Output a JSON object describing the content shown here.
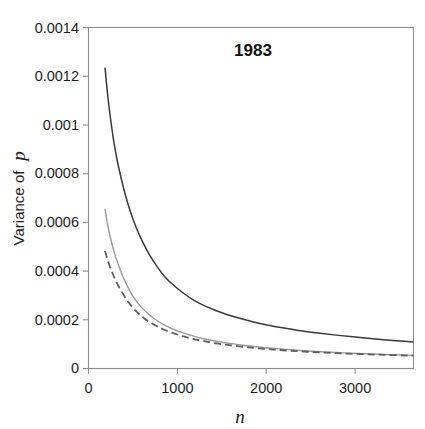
{
  "figure": {
    "background_color": "#ffffff",
    "width": 425,
    "height": 429
  },
  "chart_data": {
    "type": "line",
    "title": "1983",
    "xlabel": "n",
    "ylabel": "Variance of p",
    "ylabel_plain": "Variance of",
    "ylabel_italic": "p",
    "xlim": [
      0,
      3740
    ],
    "ylim": [
      0,
      0.0014
    ],
    "grid": false,
    "legend": "none",
    "x_ticks": [
      0,
      1000,
      2000,
      3000
    ],
    "x_tick_labels": [
      "0",
      "1000",
      "2000",
      "3000"
    ],
    "y_ticks": [
      0,
      0.0002,
      0.0004,
      0.0006,
      0.0008,
      0.001,
      0.0012,
      0.0014
    ],
    "y_tick_labels": [
      "0",
      "0.0002",
      "0.0004",
      "0.0006",
      "0.0008",
      "0.001",
      "0.0012",
      "0.0014"
    ],
    "frame_color": "#8d8d8d",
    "series": [
      {
        "name": "upper-curve",
        "color": "#3a3a3a",
        "width": 1.5,
        "dash": "none",
        "x": [
          190,
          220,
          250,
          290,
          330,
          380,
          430,
          490,
          550,
          620,
          700,
          790,
          880,
          980,
          1090,
          1200,
          1320,
          1450,
          1590,
          1740,
          1900,
          2070,
          2250,
          2440,
          2640,
          2850,
          3070,
          3300,
          3540,
          3740
        ],
        "y": [
          0.001235,
          0.001125,
          0.001035,
          0.000935,
          0.000855,
          0.000775,
          0.000705,
          0.000635,
          0.000578,
          0.000522,
          0.000468,
          0.000418,
          0.000376,
          0.000342,
          0.00031,
          0.000283,
          0.00026,
          0.00024,
          0.000222,
          0.000206,
          0.000191,
          0.000178,
          0.000166,
          0.000155,
          0.000146,
          0.000137,
          0.000129,
          0.000121,
          0.000114,
          0.000109
        ]
      },
      {
        "name": "middle-curve",
        "color": "#9a9a9a",
        "width": 1.4,
        "dash": "none",
        "x": [
          190,
          215,
          245,
          280,
          320,
          365,
          415,
          470,
          530,
          600,
          680,
          770,
          865,
          970,
          1080,
          1200,
          1330,
          1470,
          1620,
          1780,
          1950,
          2130,
          2320,
          2520,
          2730,
          2950,
          3180,
          3420,
          3670,
          3740
        ],
        "y": [
          0.000655,
          0.0006,
          0.000548,
          0.000498,
          0.00045,
          0.000405,
          0.000362,
          0.000322,
          0.000287,
          0.000255,
          0.000226,
          0.000201,
          0.00018,
          0.000162,
          0.000147,
          0.000134,
          0.000122,
          0.000112,
          0.000103,
          9.55e-05,
          8.85e-05,
          8.25e-05,
          7.7e-05,
          7.2e-05,
          6.78e-05,
          6.4e-05,
          6.06e-05,
          5.76e-05,
          5.5e-05,
          5.44e-05
        ]
      },
      {
        "name": "lower-curve",
        "color": "#5f5f5f",
        "width": 1.8,
        "dash": "dashed",
        "x": [
          190,
          215,
          245,
          280,
          320,
          365,
          415,
          470,
          530,
          600,
          680,
          770,
          865,
          970,
          1080,
          1200,
          1330,
          1470,
          1620,
          1780,
          1950,
          2130,
          2320,
          2520,
          2730,
          2950,
          3180,
          3420,
          3670,
          3740
        ],
        "y": [
          0.000482,
          0.000452,
          0.00042,
          0.000388,
          0.000356,
          0.000326,
          0.000296,
          0.000268,
          0.000242,
          0.000218,
          0.000196,
          0.000177,
          0.00016,
          0.000146,
          0.000133,
          0.000122,
          0.000112,
          0.000103,
          9.58e-05,
          8.9e-05,
          8.3e-05,
          7.78e-05,
          7.3e-05,
          6.88e-05,
          6.5e-05,
          6.15e-05,
          5.85e-05,
          5.58e-05,
          5.34e-05,
          5.28e-05
        ]
      }
    ]
  }
}
